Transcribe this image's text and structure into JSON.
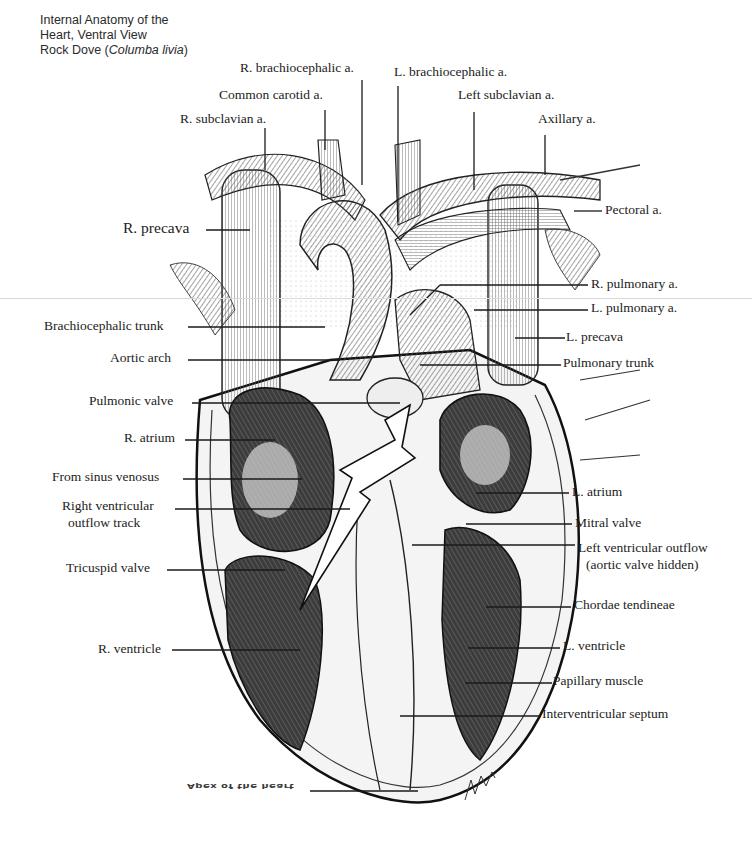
{
  "title": {
    "line1": "Internal Anatomy of the",
    "line2": "Heart, Ventral View",
    "line3_prefix": "Rock Dove (",
    "line3_species": "Columba livia",
    "line3_suffix": ")"
  },
  "labels": {
    "r_brachiocephalic": "R. brachiocephalic a.",
    "l_brachiocephalic": "L. brachiocephalic a.",
    "common_carotid": "Common carotid a.",
    "left_subclavian": "Left subclavian a.",
    "r_subclavian": "R. subclavian a.",
    "axillary": "Axillary a.",
    "pectoral": "Pectoral a.",
    "r_precava": "R. precava",
    "r_pulmonary": "R. pulmonary a.",
    "l_pulmonary": "L. pulmonary a.",
    "brachiocephalic_trunk": "Brachiocephalic trunk",
    "l_precava": "L. precava",
    "aortic_arch": "Aortic arch",
    "pulmonary_trunk": "Pulmonary trunk",
    "pulmonic_valve": "Pulmonic valve",
    "r_atrium": "R. atrium",
    "from_sinus_venosus": "From sinus venosus",
    "rv_outflow_1": "Right ventricular",
    "rv_outflow_2": "outflow track",
    "l_atrium": "L. atrium",
    "mitral_valve": "Mitral valve",
    "lv_outflow_1": "Left ventricular outflow",
    "lv_outflow_2": "(aortic valve hidden)",
    "tricuspid_valve": "Tricuspid valve",
    "chordae_tendineae": "Chordae tendineae",
    "r_ventricle": "R. ventricle",
    "l_ventricle": "L. ventricle",
    "papillary_muscle": "Papillary muscle",
    "interventricular_septum": "Interventricular septum",
    "apex": "Apex of the heart"
  },
  "colors": {
    "ink": "#1c1c1c",
    "shade": "#9a9a9a",
    "paper": "#ffffff"
  }
}
